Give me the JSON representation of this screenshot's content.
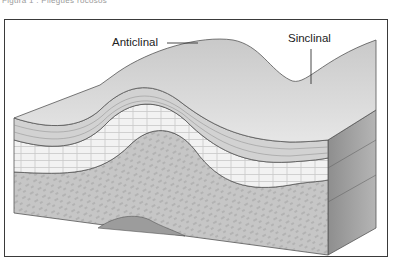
{
  "header": {
    "cutoff_caption": "Figura 1 . Pliegues rocosos"
  },
  "diagram": {
    "labels": {
      "anticline": "Anticlinal",
      "syncline": "Sinclinal"
    },
    "colors": {
      "frame": "#3a3a3a",
      "surface": "#d4d4d4",
      "strata_top": "#c8c8c8",
      "limestone": "#f1f1f1",
      "bedrock": "#bdbdbd",
      "side_face": "#9a9a9a"
    }
  }
}
